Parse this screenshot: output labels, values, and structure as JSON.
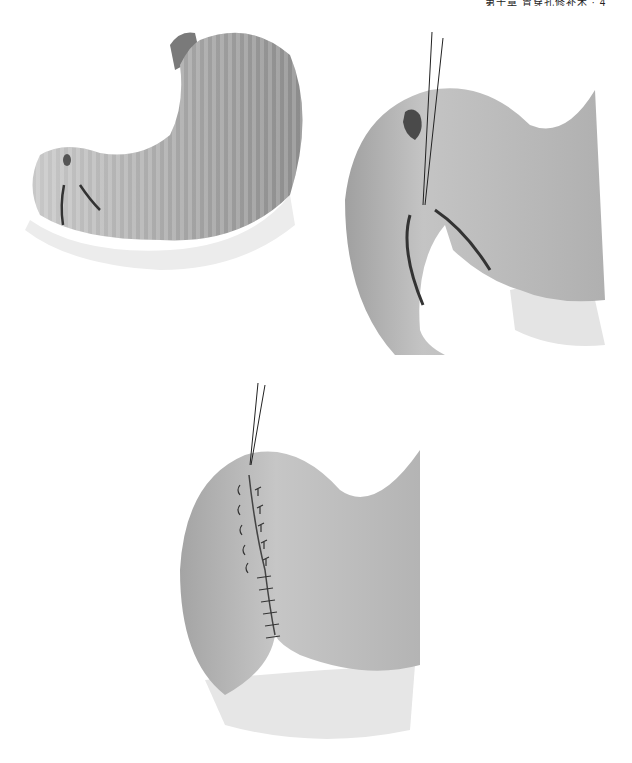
{
  "page": {
    "header_text": "第十章 胃穿孔修补术 · 4",
    "background": "#ffffff"
  },
  "figures": [
    {
      "id": "fig-a",
      "description": "Stomach with perforated ulcer near pylorus and two incisions",
      "tone": "#9a9a9a"
    },
    {
      "id": "fig-b",
      "description": "Close-up of pyloric region with ulcer, suture threads and two incisions",
      "tone": "#a0a0a0"
    },
    {
      "id": "fig-c",
      "description": "Pyloric region with completed interrupted suture line and threads",
      "tone": "#a0a0a0"
    }
  ]
}
